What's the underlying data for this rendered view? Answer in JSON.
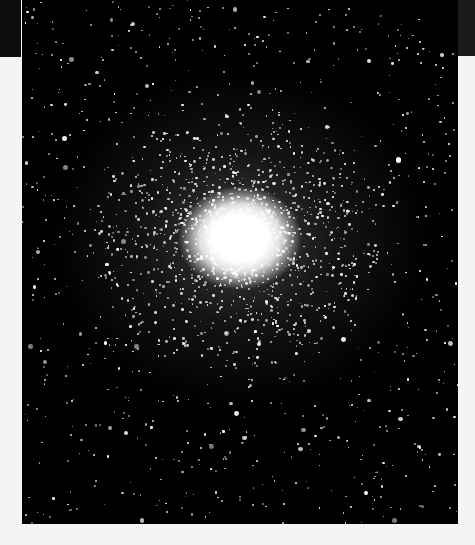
{
  "image": {
    "subject": "globular star cluster",
    "alt": "Dense globular star cluster against a black star field",
    "background_color": "#000000",
    "core_color": "#ffffff",
    "page_background": "#f4f4f4"
  },
  "starfield": {
    "field_star_count": 900,
    "cluster_star_count": 1600,
    "cluster_center": [
      218,
      238
    ],
    "cluster_radius": [
      150,
      130
    ],
    "seed": 42
  }
}
